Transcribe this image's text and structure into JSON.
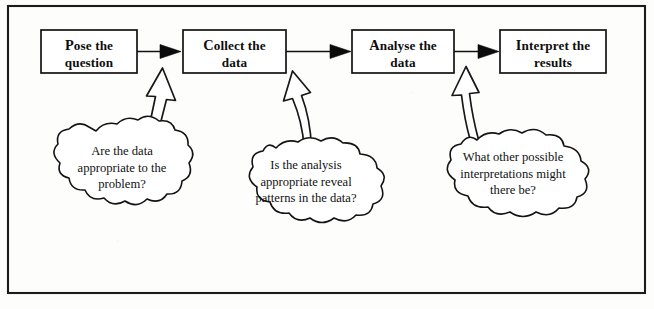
{
  "diagram": {
    "type": "flowchart",
    "frame": {
      "border_color": "#1b1b1b",
      "background": "#fdfdfc"
    },
    "stages": [
      {
        "id": "pose",
        "initial": "P",
        "line1_rest": "ose the",
        "line2": "question",
        "full_text": "Pose the question"
      },
      {
        "id": "collect",
        "initial": "C",
        "line1_rest": "ollect the",
        "line2": "data",
        "full_text": "Collect the data"
      },
      {
        "id": "analyse",
        "initial": "A",
        "line1_rest": "nalyse the",
        "line2": "data",
        "full_text": "Analyse the data"
      },
      {
        "id": "interpret",
        "initial": "I",
        "line1_rest": "nterpret the",
        "line2": "results",
        "full_text": "Interpret the results"
      }
    ],
    "clouds": [
      {
        "id": "cloud-data-appropriate",
        "lines": [
          "Are the data",
          "appropriate to the",
          "problem?"
        ],
        "full_text": "Are the data appropriate to the problem?",
        "points_to": "collect"
      },
      {
        "id": "cloud-analysis-appropriate",
        "lines": [
          "Is the analysis",
          "appropriate reveal",
          "patterns in the data?"
        ],
        "full_text": "Is the analysis appropriate reveal patterns in the data?",
        "points_to": "analyse"
      },
      {
        "id": "cloud-other-interpretations",
        "lines": [
          "What other possible",
          "interpretations might",
          "there be?"
        ],
        "full_text": "What other possible interpretations might there be?",
        "points_to": "interpret"
      }
    ],
    "flow_connectors": [
      {
        "id": "pose-to-collect",
        "from": "pose",
        "to": "collect",
        "style": "solid-arrow"
      },
      {
        "id": "collect-to-analyse",
        "from": "collect",
        "to": "analyse",
        "style": "solid-arrow"
      },
      {
        "id": "analyse-to-interpret",
        "from": "analyse",
        "to": "interpret",
        "style": "solid-arrow"
      }
    ],
    "block_arrows": [
      {
        "id": "arrow-cloud1-to-pose",
        "style": "hollow-block-arrow"
      },
      {
        "id": "arrow-cloud2-to-collect",
        "style": "hollow-block-arrow"
      },
      {
        "id": "arrow-cloud3-to-analyse",
        "style": "hollow-block-arrow"
      }
    ]
  }
}
